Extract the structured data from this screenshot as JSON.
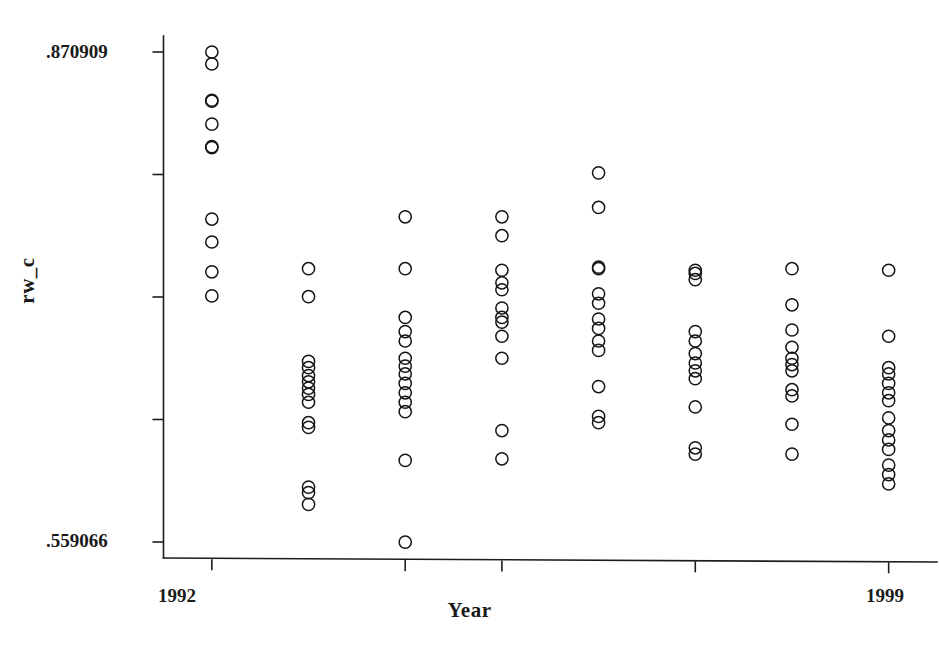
{
  "chart_data": {
    "type": "scatter",
    "title": "",
    "subtitle": "",
    "xlabel": "Year",
    "ylabel": "rw_c",
    "grid": false,
    "legend": "none",
    "marker_style": "open-circle",
    "xlim": [
      1991.5,
      1999.5
    ],
    "ylim": [
      0.559066,
      0.870909
    ],
    "y_tick_labels": [
      ".870909",
      "",
      "",
      "",
      ".559066"
    ],
    "y_tick_values": [
      0.870909,
      0.792949,
      0.714988,
      0.637027,
      0.559066
    ],
    "x_tick_labels": [
      "1992",
      "",
      "",
      "",
      "1999"
    ],
    "x_tick_values": [
      1992,
      1994,
      1995,
      1997,
      1999
    ],
    "x_categories": [
      1992,
      1993,
      1994,
      1995,
      1996,
      1997,
      1998,
      1999
    ],
    "series": [
      {
        "name": "rw_c",
        "points": [
          {
            "x": 1992,
            "y": 0.8709
          },
          {
            "x": 1992,
            "y": 0.8633
          },
          {
            "x": 1992,
            "y": 0.8402
          },
          {
            "x": 1992,
            "y": 0.8396
          },
          {
            "x": 1992,
            "y": 0.825
          },
          {
            "x": 1992,
            "y": 0.8107
          },
          {
            "x": 1992,
            "y": 0.8101
          },
          {
            "x": 1992,
            "y": 0.7646
          },
          {
            "x": 1992,
            "y": 0.75
          },
          {
            "x": 1992,
            "y": 0.731
          },
          {
            "x": 1992,
            "y": 0.7157
          },
          {
            "x": 1993,
            "y": 0.733
          },
          {
            "x": 1993,
            "y": 0.7152
          },
          {
            "x": 1993,
            "y": 0.674
          },
          {
            "x": 1993,
            "y": 0.67
          },
          {
            "x": 1993,
            "y": 0.665
          },
          {
            "x": 1993,
            "y": 0.661
          },
          {
            "x": 1993,
            "y": 0.657
          },
          {
            "x": 1993,
            "y": 0.653
          },
          {
            "x": 1993,
            "y": 0.648
          },
          {
            "x": 1993,
            "y": 0.635
          },
          {
            "x": 1993,
            "y": 0.632
          },
          {
            "x": 1993,
            "y": 0.594
          },
          {
            "x": 1993,
            "y": 0.5905
          },
          {
            "x": 1993,
            "y": 0.583
          },
          {
            "x": 1994,
            "y": 0.766
          },
          {
            "x": 1994,
            "y": 0.733
          },
          {
            "x": 1994,
            "y": 0.702
          },
          {
            "x": 1994,
            "y": 0.693
          },
          {
            "x": 1994,
            "y": 0.687
          },
          {
            "x": 1994,
            "y": 0.676
          },
          {
            "x": 1994,
            "y": 0.671
          },
          {
            "x": 1994,
            "y": 0.666
          },
          {
            "x": 1994,
            "y": 0.66
          },
          {
            "x": 1994,
            "y": 0.654
          },
          {
            "x": 1994,
            "y": 0.648
          },
          {
            "x": 1994,
            "y": 0.642
          },
          {
            "x": 1994,
            "y": 0.611
          },
          {
            "x": 1994,
            "y": 0.559
          },
          {
            "x": 1995,
            "y": 0.766
          },
          {
            "x": 1995,
            "y": 0.754
          },
          {
            "x": 1995,
            "y": 0.732
          },
          {
            "x": 1995,
            "y": 0.724
          },
          {
            "x": 1995,
            "y": 0.7196
          },
          {
            "x": 1995,
            "y": 0.708
          },
          {
            "x": 1995,
            "y": 0.702
          },
          {
            "x": 1995,
            "y": 0.699
          },
          {
            "x": 1995,
            "y": 0.69
          },
          {
            "x": 1995,
            "y": 0.676
          },
          {
            "x": 1995,
            "y": 0.63
          },
          {
            "x": 1995,
            "y": 0.612
          },
          {
            "x": 1996,
            "y": 0.794
          },
          {
            "x": 1996,
            "y": 0.772
          },
          {
            "x": 1996,
            "y": 0.734
          },
          {
            "x": 1996,
            "y": 0.733
          },
          {
            "x": 1996,
            "y": 0.717
          },
          {
            "x": 1996,
            "y": 0.711
          },
          {
            "x": 1996,
            "y": 0.701
          },
          {
            "x": 1996,
            "y": 0.695
          },
          {
            "x": 1996,
            "y": 0.687
          },
          {
            "x": 1996,
            "y": 0.681
          },
          {
            "x": 1996,
            "y": 0.658
          },
          {
            "x": 1996,
            "y": 0.639
          },
          {
            "x": 1996,
            "y": 0.635
          },
          {
            "x": 1997,
            "y": 0.732
          },
          {
            "x": 1997,
            "y": 0.73
          },
          {
            "x": 1997,
            "y": 0.726
          },
          {
            "x": 1997,
            "y": 0.693
          },
          {
            "x": 1997,
            "y": 0.687
          },
          {
            "x": 1997,
            "y": 0.679
          },
          {
            "x": 1997,
            "y": 0.673
          },
          {
            "x": 1997,
            "y": 0.668
          },
          {
            "x": 1997,
            "y": 0.663
          },
          {
            "x": 1997,
            "y": 0.645
          },
          {
            "x": 1997,
            "y": 0.619
          },
          {
            "x": 1997,
            "y": 0.615
          },
          {
            "x": 1998,
            "y": 0.733
          },
          {
            "x": 1998,
            "y": 0.71
          },
          {
            "x": 1998,
            "y": 0.694
          },
          {
            "x": 1998,
            "y": 0.683
          },
          {
            "x": 1998,
            "y": 0.676
          },
          {
            "x": 1998,
            "y": 0.672
          },
          {
            "x": 1998,
            "y": 0.668
          },
          {
            "x": 1998,
            "y": 0.656
          },
          {
            "x": 1998,
            "y": 0.652
          },
          {
            "x": 1998,
            "y": 0.634
          },
          {
            "x": 1998,
            "y": 0.615
          },
          {
            "x": 1999,
            "y": 0.732
          },
          {
            "x": 1999,
            "y": 0.69
          },
          {
            "x": 1999,
            "y": 0.67
          },
          {
            "x": 1999,
            "y": 0.666
          },
          {
            "x": 1999,
            "y": 0.66
          },
          {
            "x": 1999,
            "y": 0.654
          },
          {
            "x": 1999,
            "y": 0.649
          },
          {
            "x": 1999,
            "y": 0.638
          },
          {
            "x": 1999,
            "y": 0.63
          },
          {
            "x": 1999,
            "y": 0.624
          },
          {
            "x": 1999,
            "y": 0.618
          },
          {
            "x": 1999,
            "y": 0.608
          },
          {
            "x": 1999,
            "y": 0.602
          },
          {
            "x": 1999,
            "y": 0.596
          }
        ]
      }
    ]
  },
  "axes": {
    "y_top_label": ".870909",
    "y_bottom_label": ".559066",
    "x_left_label": "1992",
    "x_right_label": "1999",
    "x_title": "Year",
    "y_title": "rw_c"
  },
  "style": {
    "marker_color": "#141414",
    "axis_color": "#1c1c1c",
    "background": "#ffffff"
  }
}
